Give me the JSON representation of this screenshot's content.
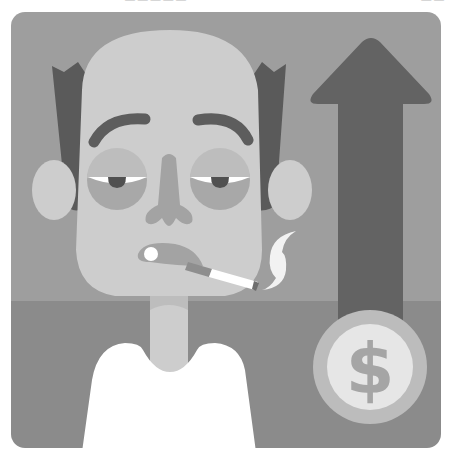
{
  "header": {
    "left_text": "— — — — —",
    "right_text": "— —"
  },
  "illustration": {
    "subject": "tired smoking man with rising cost arrow and dollar coin",
    "icons": [
      "arrow-up-icon",
      "dollar-coin-icon",
      "cigarette-icon",
      "smoke-icon"
    ],
    "coin_symbol": "$",
    "colors": {
      "background_top": "#9e9e9e",
      "background_bottom": "#8b8b8b",
      "skin": "#cdcdcd",
      "skin_shadow": "#a3a3a3",
      "hair": "#5a5a5a",
      "eyebrow": "#5d5d5d",
      "eye_bag": "#a8a8a8",
      "eye_lid": "#bdbdbd",
      "arrow": "#636363",
      "coin_outer": "#bcbcbc",
      "coin_inner": "#e6e6e6",
      "coin_symbol": "#a5a5a5",
      "shirt": "#ffffff",
      "smoke": "#f2f2f2"
    }
  }
}
